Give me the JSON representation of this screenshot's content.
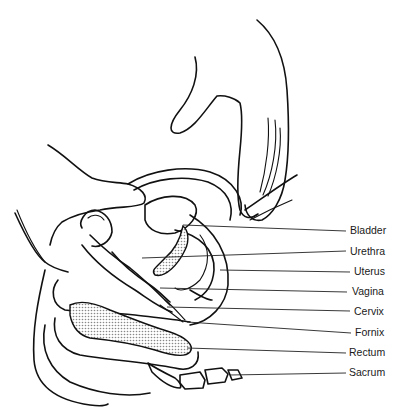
{
  "figure": {
    "type": "anatomical-line-drawing",
    "labels": [
      {
        "text": "Bladder",
        "x": 350,
        "y": 229
      },
      {
        "text": "Urethra",
        "x": 350,
        "y": 251
      },
      {
        "text": "Uterus",
        "x": 354,
        "y": 271
      },
      {
        "text": "Vagina",
        "x": 352,
        "y": 291
      },
      {
        "text": "Cervix",
        "x": 354,
        "y": 310
      },
      {
        "text": "Fornix",
        "x": 355,
        "y": 332
      },
      {
        "text": "Rectum",
        "x": 349,
        "y": 352
      },
      {
        "text": "Sacrum",
        "x": 349,
        "y": 372
      }
    ],
    "colors": {
      "line": "#111111",
      "shading": "#bdbdbd",
      "background": "#ffffff"
    }
  }
}
